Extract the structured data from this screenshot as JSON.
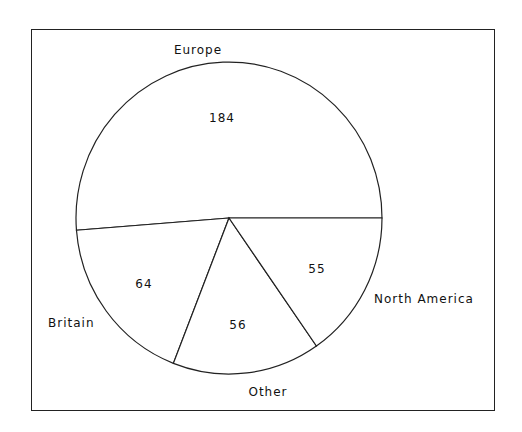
{
  "chart_data": {
    "type": "pie",
    "title": "",
    "categories": [
      "Europe",
      "Britain",
      "Other",
      "North America"
    ],
    "values": [
      184,
      64,
      56,
      55
    ],
    "value_labels": [
      "184",
      "64",
      "56",
      "55"
    ],
    "start_angle_deg": 0,
    "direction": "counterclockwise",
    "legend": "none (slice labels outside)",
    "colors": {
      "fill": "#ffffff",
      "stroke": "#222222",
      "text": "#111111"
    }
  }
}
